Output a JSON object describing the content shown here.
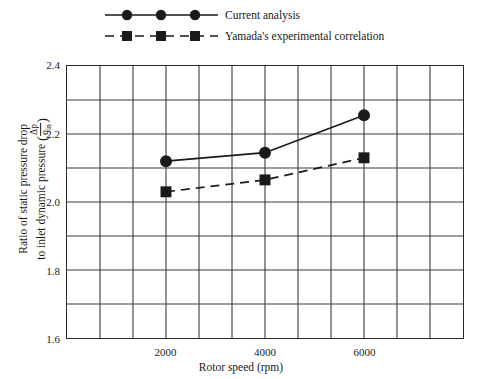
{
  "chart_data": {
    "type": "line",
    "title": "",
    "xlabel": "Rotor speed (rpm)",
    "ylabel_line1": "Ratio of static pressure drop",
    "ylabel_line2": "to inlet dynamic pressure",
    "ylabel_fraction_num": "Δp",
    "ylabel_fraction_den": "q",
    "ylabel_fraction_den_sub": "in",
    "x": [
      2000,
      4000,
      6000
    ],
    "xlim": [
      0,
      8000
    ],
    "ylim": [
      1.6,
      2.4
    ],
    "xticks": [
      2000,
      4000,
      6000
    ],
    "xtick_labels": [
      "2000",
      "4000",
      "6000"
    ],
    "yticks": [
      1.6,
      1.8,
      2.0,
      2.2,
      2.4
    ],
    "ytick_labels": [
      "1.6",
      "1.8",
      "2.0",
      "2.2",
      "2.4"
    ],
    "y_minor_step": 0.1,
    "x_minor_step": 666.67,
    "x_gridline_count": 12,
    "y_gridline_count": 8,
    "grid": true,
    "legend_position": "above-plot",
    "series": [
      {
        "name": "Current analysis",
        "marker": "circle",
        "linestyle": "solid",
        "color": "#1a1a1a",
        "values": [
          2.12,
          2.145,
          2.255
        ]
      },
      {
        "name": "Yamada's experimental correlation",
        "marker": "square",
        "linestyle": "dashed",
        "color": "#1a1a1a",
        "values": [
          2.03,
          2.065,
          2.13
        ]
      }
    ]
  },
  "legend": {
    "items": [
      {
        "label": "Current analysis",
        "marker": "circle",
        "linestyle": "solid"
      },
      {
        "label": "Yamada's experimental correlation",
        "marker": "square",
        "linestyle": "dashed"
      }
    ]
  },
  "colors": {
    "ink": "#1a1a1a",
    "frame": "#2b2b2b",
    "grid": "#3a3a3a",
    "background": "#ffffff"
  }
}
